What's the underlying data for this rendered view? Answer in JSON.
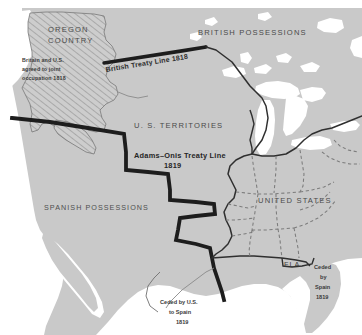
{
  "map": {
    "title": "United States Territorial Boundaries 1818-1819",
    "canvas": {
      "width": 362,
      "height": 335
    },
    "colors": {
      "land": "#c9c9c9",
      "water": "#ffffff",
      "page_background": "#ffffff",
      "boundary_heavy": "#1d1d1d",
      "boundary_thin": "#333333",
      "state_dashed": "#7d7d7d",
      "hatch_line": "#9a9a9a",
      "label_text": "#4a4a4a",
      "note_text": "#3a3a3a"
    },
    "regions": [
      {
        "id": "oregon-country",
        "label": "OREGON COUNTRY",
        "label_lines": [
          "OREGON",
          "COUNTRY"
        ],
        "fill": "hatched",
        "note": "Britain and U.S. agreed to joint occupation 1818",
        "note_lines": [
          "Britain and U.S.",
          "agreed to joint",
          "occupation 1818"
        ]
      },
      {
        "id": "british-possessions",
        "label": "BRITISH POSSESSIONS",
        "fill": "land"
      },
      {
        "id": "us-territories",
        "label": "U. S. TERRITORIES",
        "fill": "land"
      },
      {
        "id": "spanish-possessions",
        "label": "SPANISH POSSESSIONS",
        "fill": "land"
      },
      {
        "id": "united-states",
        "label": "UNITED STATES",
        "fill": "land"
      },
      {
        "id": "florida",
        "label": "FLA.",
        "fill": "land",
        "note": "Ceded by Spain 1819",
        "note_lines": [
          "Ceded",
          "by",
          "Spain",
          "1819"
        ]
      }
    ],
    "boundaries": [
      {
        "id": "british-treaty-line-1818",
        "label": "British Treaty Line 1818",
        "style": "heavy-solid",
        "rotation_deg": -10.5
      },
      {
        "id": "adams-onis-treaty-line-1819",
        "label_lines": [
          "Adams–Onis Treaty Line",
          "1819"
        ],
        "label": "Adams-Onis Treaty Line 1819",
        "style": "heavy-stepped"
      },
      {
        "id": "mississippi-boundary",
        "style": "thin-solid"
      },
      {
        "id": "state-boundaries",
        "style": "dashed"
      }
    ],
    "annotations": [
      {
        "id": "ceded-by-us-to-spain",
        "lines": [
          "Ceded by U.S.",
          "to Spain",
          "1819"
        ],
        "text": "Ceded by U.S. to Spain 1819"
      }
    ]
  }
}
